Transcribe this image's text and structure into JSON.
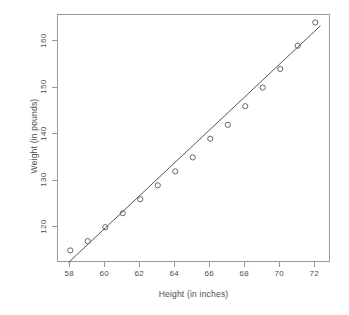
{
  "chart_data": {
    "type": "scatter",
    "title": "",
    "xlabel": "Height (in inches)",
    "ylabel": "Weight (in pounds)",
    "x": [
      58,
      59,
      60,
      61,
      62,
      63,
      64,
      65,
      66,
      67,
      68,
      69,
      70,
      71,
      72
    ],
    "y": [
      115,
      117,
      120,
      123,
      126,
      129,
      132,
      135,
      139,
      142,
      146,
      150,
      154,
      159,
      164
    ],
    "series": [
      {
        "name": "observations",
        "type": "scatter",
        "marker": "open-circle",
        "color": "#666666",
        "points": [
          {
            "x": 58,
            "y": 115
          },
          {
            "x": 59,
            "y": 117
          },
          {
            "x": 60,
            "y": 120
          },
          {
            "x": 61,
            "y": 123
          },
          {
            "x": 62,
            "y": 126
          },
          {
            "x": 63,
            "y": 129
          },
          {
            "x": 64,
            "y": 132
          },
          {
            "x": 65,
            "y": 135
          },
          {
            "x": 66,
            "y": 139
          },
          {
            "x": 67,
            "y": 142
          },
          {
            "x": 68,
            "y": 146
          },
          {
            "x": 69,
            "y": 150
          },
          {
            "x": 70,
            "y": 154
          },
          {
            "x": 71,
            "y": 159
          },
          {
            "x": 72,
            "y": 164
          }
        ]
      },
      {
        "name": "regression-line",
        "type": "line",
        "color": "#555555",
        "endpoints": [
          {
            "x": 57.9,
            "y": 112.4
          },
          {
            "x": 72.3,
            "y": 163.3
          }
        ]
      }
    ],
    "xlim": [
      57.3,
      72.9
    ],
    "ylim": [
      112.3,
      165.6
    ],
    "xticks": [
      58,
      60,
      62,
      64,
      66,
      68,
      70,
      72
    ],
    "xtick_labels": [
      "58",
      "60",
      "62",
      "64",
      "66",
      "68",
      "70",
      "72"
    ],
    "yticks": [
      120,
      130,
      140,
      150,
      160
    ],
    "ytick_labels": [
      "120",
      "130",
      "140",
      "150",
      "160"
    ],
    "grid": false,
    "legend": false,
    "legend_position": "none",
    "background_color": "#ffffff",
    "frame_color": "#9a9a9a",
    "axis_text_color": "#4d4d4d"
  }
}
